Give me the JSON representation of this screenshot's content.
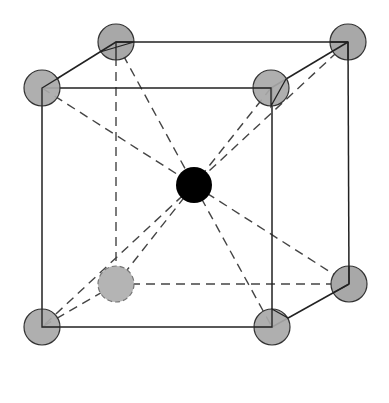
{
  "diagram": {
    "colors": {
      "corner_atom": "#a8a8a8",
      "center_atom": "#000000",
      "edge": "#222222",
      "hidden_edge": "#444444",
      "background": "#ffffff"
    },
    "corner_atoms": [
      {
        "id": "front-top-left",
        "x": 42,
        "y": 88
      },
      {
        "id": "front-top-right",
        "x": 271,
        "y": 88
      },
      {
        "id": "front-bottom-left",
        "x": 42,
        "y": 327
      },
      {
        "id": "front-bottom-right",
        "x": 272,
        "y": 327
      },
      {
        "id": "back-top-left",
        "x": 116,
        "y": 42
      },
      {
        "id": "back-top-right",
        "x": 348,
        "y": 42
      },
      {
        "id": "back-bottom-left",
        "x": 116,
        "y": 284
      },
      {
        "id": "back-bottom-right",
        "x": 349,
        "y": 284
      }
    ],
    "center_atom": {
      "id": "body-center",
      "x": 194,
      "y": 185
    }
  }
}
